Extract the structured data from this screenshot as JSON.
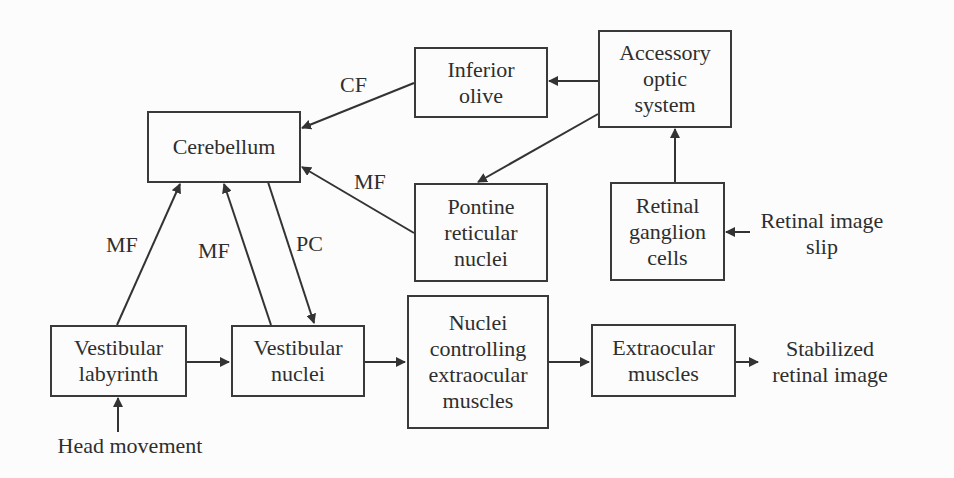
{
  "diagram": {
    "nodes": {
      "cerebellum": "Cerebellum",
      "inferior_olive_l1": "Inferior",
      "inferior_olive_l2": "olive",
      "accessory_l1": "Accessory",
      "accessory_l2": "optic",
      "accessory_l3": "system",
      "pontine_l1": "Pontine",
      "pontine_l2": "reticular",
      "pontine_l3": "nuclei",
      "retinal_l1": "Retinal",
      "retinal_l2": "ganglion",
      "retinal_l3": "cells",
      "vest_lab_l1": "Vestibular",
      "vest_lab_l2": "labyrinth",
      "vest_nuc_l1": "Vestibular",
      "vest_nuc_l2": "nuclei",
      "nuc_ctrl_l1": "Nuclei",
      "nuc_ctrl_l2": "controlling",
      "nuc_ctrl_l3": "extraocular",
      "nuc_ctrl_l4": "muscles",
      "extraocular_l1": "Extraocular",
      "extraocular_l2": "muscles"
    },
    "inputs": {
      "retinal_slip_l1": "Retinal image",
      "retinal_slip_l2": "slip",
      "head_movement": "Head movement"
    },
    "outputs": {
      "stabilized_l1": "Stabilized",
      "stabilized_l2": "retinal image"
    },
    "edge_labels": {
      "cf": "CF",
      "mf_pontine": "MF",
      "mf_labyrinth": "MF",
      "mf_nuclei": "MF",
      "pc": "PC"
    }
  }
}
